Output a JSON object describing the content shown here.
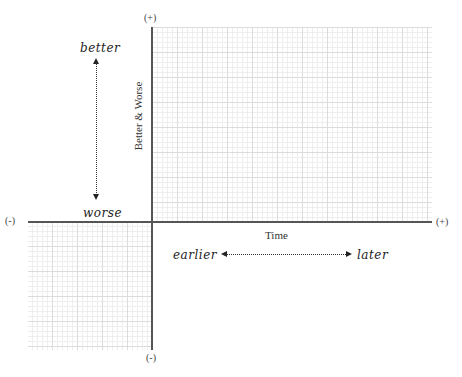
{
  "diagram": {
    "y_axis": {
      "label": "Better & Worse",
      "top_sign": "(+)",
      "bottom_sign": "(-)",
      "arrow_top_label": "better",
      "arrow_bottom_label": "worse"
    },
    "x_axis": {
      "label": "Time",
      "left_sign": "(-)",
      "right_sign": "(+)",
      "arrow_left_label": "earlier",
      "arrow_right_label": "later"
    },
    "colors": {
      "axis": "#555555",
      "grid_minor": "#eeeeee",
      "grid_major": "#dcdcdc",
      "text": "#333333"
    }
  }
}
